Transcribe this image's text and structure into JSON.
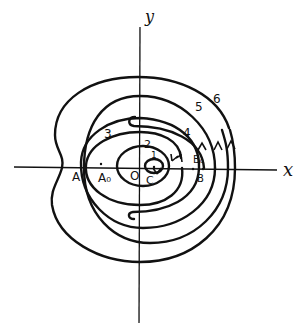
{
  "axes": {
    "x_label": "x",
    "y_label": "y",
    "origin_label": "O"
  },
  "points": {
    "A": "A",
    "A0": "A₀",
    "B": "B",
    "B0": "B₀",
    "C": "C"
  },
  "curve_labels": [
    "1",
    "2",
    "3",
    "4",
    "5",
    "6"
  ],
  "colors": {
    "ink": "#111111",
    "background": "#ffffff"
  }
}
